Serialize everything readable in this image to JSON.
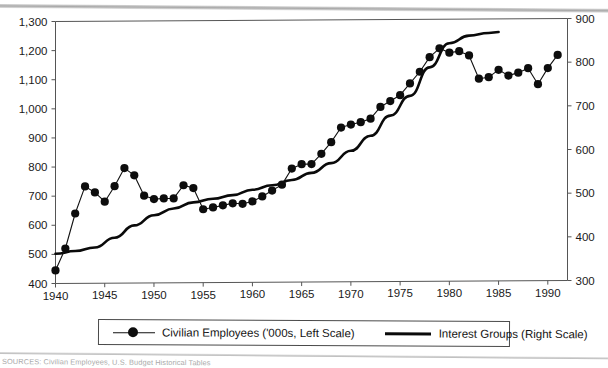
{
  "figure": {
    "background_color": "#ffffff",
    "ink_color": "#111111",
    "axis_color": "#555555"
  },
  "legend": {
    "position": "bottom-center",
    "entries": [
      {
        "label": "Civilian Employees ('000s, Left Scale)",
        "marker": "line-with-filled-circle",
        "axis": "left"
      },
      {
        "label": "Interest Groups (Right Scale)",
        "marker": "thick-line",
        "axis": "right"
      }
    ]
  },
  "source_note": "SOURCES: Civilian Employees, U.S. Budget Historical Tables",
  "chart_data": {
    "type": "line",
    "title": "",
    "subtitle": "",
    "xlabel": "",
    "ylabel": "",
    "grid": false,
    "legend_position": "bottom",
    "xlim": [
      1940,
      1992
    ],
    "xticks": [
      1940,
      1945,
      1950,
      1955,
      1960,
      1965,
      1970,
      1975,
      1980,
      1985,
      1990
    ],
    "xtick_labels": [
      "1940",
      "1945",
      "1950",
      "1955",
      "1960",
      "1965",
      "1970",
      "1975",
      "1980",
      "1985",
      "1990"
    ],
    "left_axis": {
      "label": "Civilian Employees ('000s)",
      "ylim": [
        400,
        1300
      ],
      "yticks": [
        400,
        500,
        600,
        700,
        800,
        900,
        1000,
        1100,
        1200,
        1300
      ],
      "ytick_labels": [
        "400",
        "500",
        "600",
        "700",
        "800",
        "900",
        "1,000",
        "1,100",
        "1,200",
        "1,300"
      ]
    },
    "right_axis": {
      "label": "Interest Groups",
      "ylim": [
        300,
        900
      ],
      "yticks": [
        300,
        400,
        500,
        600,
        700,
        800,
        900
      ],
      "ytick_labels": [
        "300",
        "400",
        "500",
        "600",
        "700",
        "800",
        "900"
      ]
    },
    "series": [
      {
        "name": "Civilian Employees ('000s, Left Scale)",
        "axis": "left",
        "style": "line-markers",
        "x": [
          1940,
          1941,
          1942,
          1943,
          1944,
          1945,
          1946,
          1947,
          1948,
          1949,
          1950,
          1951,
          1952,
          1953,
          1954,
          1955,
          1956,
          1957,
          1958,
          1959,
          1960,
          1961,
          1962,
          1963,
          1964,
          1965,
          1966,
          1967,
          1968,
          1969,
          1970,
          1971,
          1972,
          1973,
          1974,
          1975,
          1976,
          1977,
          1978,
          1979,
          1980,
          1981,
          1982,
          1983,
          1984,
          1985,
          1986,
          1987,
          1988,
          1989,
          1990,
          1991
        ],
        "values": [
          445,
          520,
          640,
          733,
          712,
          680,
          733,
          795,
          770,
          700,
          688,
          690,
          690,
          735,
          725,
          652,
          658,
          665,
          672,
          670,
          678,
          695,
          715,
          735,
          790,
          805,
          805,
          840,
          880,
          930,
          940,
          948,
          960,
          1000,
          1020,
          1040,
          1080,
          1120,
          1170,
          1200,
          1185,
          1190,
          1175,
          1095,
          1100,
          1125,
          1105,
          1115,
          1130,
          1075,
          1130,
          1175
        ]
      },
      {
        "name": "Interest Groups (Right Scale)",
        "axis": "right",
        "style": "line",
        "x": [
          1940,
          1942,
          1944,
          1946,
          1948,
          1950,
          1952,
          1954,
          1956,
          1958,
          1960,
          1962,
          1964,
          1966,
          1968,
          1970,
          1972,
          1974,
          1976,
          1978,
          1980,
          1982,
          1984,
          1985
        ],
        "values": [
          368,
          374,
          382,
          404,
          432,
          455,
          470,
          484,
          492,
          500,
          512,
          522,
          534,
          550,
          572,
          600,
          634,
          680,
          725,
          790,
          845,
          862,
          868,
          870
        ]
      }
    ]
  }
}
